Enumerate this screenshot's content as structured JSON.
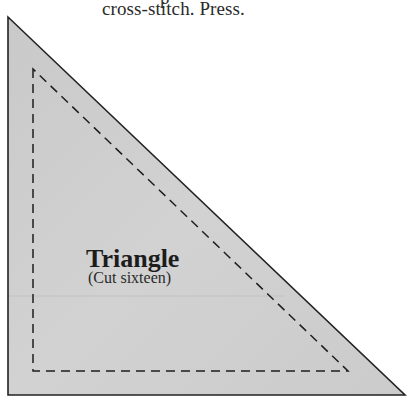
{
  "document": {
    "caption_prev_fragment": "p",
    "caption": "cross-stitch. Press."
  },
  "template": {
    "shape": "right-triangle",
    "title": "Triangle",
    "subtitle": "(Cut sixteen)",
    "colors": {
      "fill": "#cdcdcd",
      "outline": "#222222",
      "seam_line": "#1e1e1e",
      "page_background": "#ffffff"
    },
    "outer_vertices": [
      [
        8,
        17
      ],
      [
        8,
        395
      ],
      [
        405,
        395
      ]
    ],
    "seam_vertices": [
      [
        33,
        69
      ],
      [
        33,
        371
      ],
      [
        348,
        371
      ]
    ],
    "seam_style": "dashed"
  }
}
